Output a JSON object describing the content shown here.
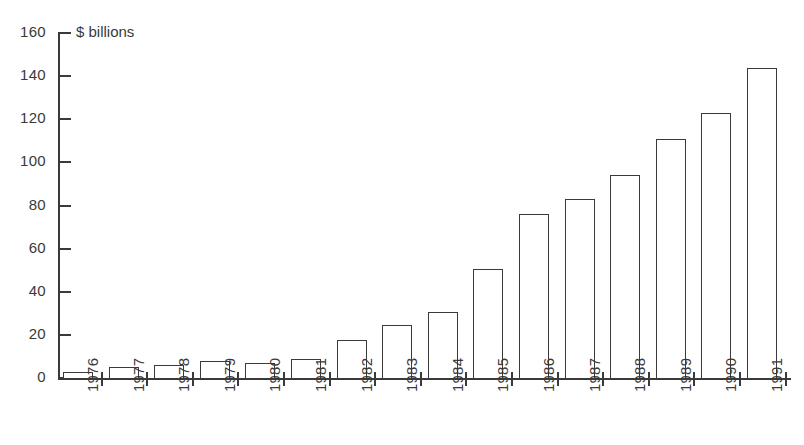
{
  "chart_data": {
    "type": "bar",
    "title": "",
    "subtitle": "",
    "unit_label": "$ billions",
    "xlabel": "",
    "ylabel": "$ billions",
    "ylim": [
      0,
      160
    ],
    "ytick_step": 20,
    "grid": false,
    "legend": "none",
    "categories": [
      "1976",
      "1977",
      "1978",
      "1979",
      "1980",
      "1981",
      "1982",
      "1983",
      "1984",
      "1985",
      "1986",
      "1987",
      "1988",
      "1989",
      "1990",
      "1991"
    ],
    "values": [
      3,
      5,
      6,
      8,
      7,
      9,
      17.5,
      24.5,
      30.5,
      50.5,
      76,
      83,
      94,
      111,
      123,
      144
    ],
    "ytick_labels": [
      "0",
      "20",
      "40",
      "60",
      "80",
      "100",
      "120",
      "140",
      "160"
    ],
    "ytick_values": [
      0,
      20,
      40,
      60,
      80,
      100,
      120,
      140,
      160
    ],
    "bar_style": {
      "fill": "#ffffff",
      "stroke": "#3a3a3a"
    },
    "axis_color": "#3a3a3a"
  }
}
